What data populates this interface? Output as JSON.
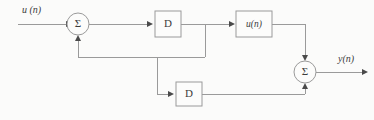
{
  "figure": {
    "type": "signal-flow-block-diagram",
    "background_color": "#fbfbfa",
    "line_color": "#9a9a9a",
    "text_color": "#3c3c3c",
    "arrow_color": "#4a4a4a"
  },
  "labels": {
    "input_signal": "u (n)",
    "output_signal": "y(n)",
    "delay_top": "D",
    "delay_bottom": "D",
    "middle_block": "u(n)",
    "sum_symbol_left": "Σ",
    "sum_symbol_right": "Σ"
  },
  "nodes": [
    {
      "id": "input-terminal",
      "name": "input-signal-label",
      "label": "u (n)",
      "kind": "terminal",
      "x": 20,
      "y": 10
    },
    {
      "id": "summer-left",
      "name": "summing-junction-left",
      "label": "Σ",
      "kind": "summer",
      "cx": 78,
      "cy": 24,
      "r": 11
    },
    {
      "id": "delay-top",
      "name": "delay-block-top",
      "label": "D",
      "kind": "block",
      "x": 155,
      "y": 11,
      "w": 26,
      "h": 26
    },
    {
      "id": "block-middle",
      "name": "signal-block-middle",
      "label": "u(n)",
      "kind": "block",
      "x": 236,
      "y": 11,
      "w": 36,
      "h": 26
    },
    {
      "id": "delay-bottom",
      "name": "delay-block-bottom",
      "label": "D",
      "kind": "block",
      "x": 176,
      "y": 82,
      "w": 26,
      "h": 24
    },
    {
      "id": "summer-right",
      "name": "summing-junction-right",
      "label": "Σ",
      "kind": "summer",
      "cx": 305,
      "cy": 72,
      "r": 11
    },
    {
      "id": "output-terminal",
      "name": "output-signal-label",
      "label": "y(n)",
      "kind": "terminal",
      "x": 338,
      "y": 58
    }
  ],
  "edges": [
    {
      "name": "edge-input-to-summer-left",
      "from": "input-terminal",
      "to": "summer-left",
      "arrow": true
    },
    {
      "name": "edge-summer-left-to-delay-top",
      "from": "summer-left",
      "to": "delay-top",
      "arrow": true
    },
    {
      "name": "edge-delay-top-to-block-middle",
      "from": "delay-top",
      "to": "block-middle",
      "arrow": true
    },
    {
      "name": "edge-block-middle-to-summer-right",
      "from": "block-middle",
      "to": "summer-right",
      "arrow": true
    },
    {
      "name": "edge-feedback-bus-to-summer-left",
      "from": "delay-top",
      "to": "summer-left",
      "arrow": true
    },
    {
      "name": "edge-feedback-tap-to-delay-bottom",
      "from": "feedback-bus",
      "to": "delay-bottom",
      "arrow": true
    },
    {
      "name": "edge-delay-bottom-to-summer-right",
      "from": "delay-bottom",
      "to": "summer-right",
      "arrow": true
    },
    {
      "name": "edge-summer-right-to-output",
      "from": "summer-right",
      "to": "output-terminal",
      "arrow": true
    }
  ]
}
